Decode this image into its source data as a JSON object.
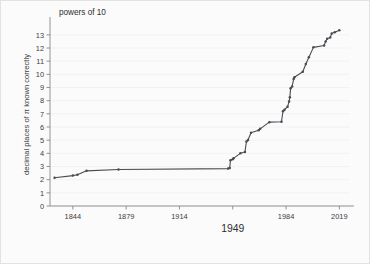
{
  "chart_data": {
    "type": "line",
    "title": "powers of 10",
    "xlabel": "",
    "ylabel": "decimal places of π known correctly",
    "xlim": [
      1829,
      2026
    ],
    "ylim": [
      0,
      13.9
    ],
    "grid": true,
    "legend": null,
    "x_ticks": [
      1844,
      1879,
      1914,
      1949,
      1984,
      2019
    ],
    "x_tick_labels": [
      "1844",
      "1879",
      "1914",
      "1949",
      "1984",
      "2019"
    ],
    "x_tick_emphasis": "1949",
    "y_ticks": [
      0,
      1,
      2,
      3,
      4,
      5,
      6,
      7,
      8,
      9,
      10,
      11,
      12,
      13
    ],
    "y_tick_labels": [
      "0",
      "1",
      "2",
      "3",
      "4",
      "5",
      "6",
      "7",
      "8",
      "9",
      "10",
      "11",
      "12",
      "13"
    ],
    "series": [
      {
        "name": "log10 of decimal places of pi known correctly",
        "marker": "dot",
        "color": "#4b4b52",
        "x": [
          1832,
          1844,
          1847,
          1853,
          1874,
          1946,
          1947,
          1947.5,
          1949,
          1949.5,
          1954,
          1957,
          1958,
          1959,
          1961,
          1966,
          1967,
          1973,
          1981,
          1982,
          1983,
          1985,
          1986,
          1986.5,
          1987,
          1988,
          1989,
          1989.5,
          1995,
          1997,
          1999,
          2002,
          2009,
          2010,
          2011,
          2013,
          2014,
          2016,
          2019
        ],
        "y": [
          2.15,
          2.31,
          2.38,
          2.67,
          2.77,
          2.84,
          2.88,
          3.48,
          3.56,
          3.62,
          4.0,
          4.1,
          4.89,
          5.02,
          5.56,
          5.76,
          5.86,
          6.37,
          6.4,
          7.2,
          7.32,
          7.54,
          7.94,
          8.26,
          8.95,
          9.08,
          9.64,
          9.78,
          10.2,
          10.79,
          11.3,
          12.05,
          12.19,
          12.5,
          12.7,
          12.79,
          13.1,
          13.2,
          13.35
        ]
      }
    ]
  }
}
